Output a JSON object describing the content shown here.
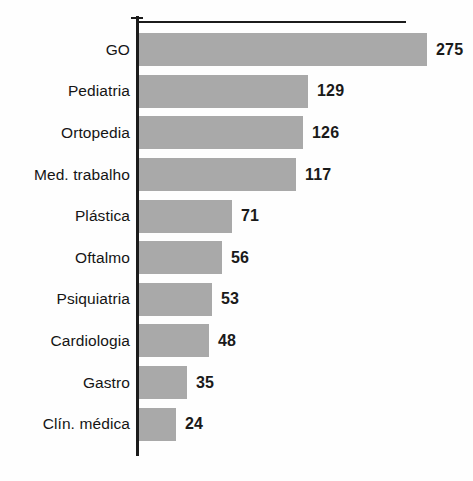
{
  "chart_data": {
    "type": "bar",
    "orientation": "horizontal",
    "title": "",
    "subtitle": "",
    "xlabel": "",
    "ylabel": "",
    "grid": false,
    "legend": null,
    "xlim": [
      0,
      300
    ],
    "axis_line_top": true,
    "categories": [
      "GO",
      "Pediatria",
      "Ortopedia",
      "Med. trabalho",
      "Plástica",
      "Oftalmo",
      "Psiquiatria",
      "Cardiologia",
      "Gastro",
      "Clín. médica"
    ],
    "values": [
      275,
      129,
      126,
      117,
      71,
      56,
      53,
      48,
      35,
      24
    ],
    "value_labels": [
      "275",
      "129",
      "126",
      "117",
      "71",
      "56",
      "53",
      "48",
      "35",
      "24"
    ],
    "bars": [
      {
        "label": "GO",
        "value": 275,
        "value_label": "275",
        "pixel_width": 288
      },
      {
        "label": "Pediatria",
        "value": 129,
        "value_label": "129",
        "pixel_width": 169
      },
      {
        "label": "Ortopedia",
        "value": 126,
        "value_label": "126",
        "pixel_width": 164
      },
      {
        "label": "Med. trabalho",
        "value": 117,
        "value_label": "117",
        "pixel_width": 157
      },
      {
        "label": "Plástica",
        "value": 71,
        "value_label": "71",
        "pixel_width": 93
      },
      {
        "label": "Oftalmo",
        "value": 56,
        "value_label": "56",
        "pixel_width": 83
      },
      {
        "label": "Psiquiatria",
        "value": 53,
        "value_label": "53",
        "pixel_width": 73
      },
      {
        "label": "Cardiologia",
        "value": 48,
        "value_label": "48",
        "pixel_width": 70
      },
      {
        "label": "Gastro",
        "value": 35,
        "value_label": "35",
        "pixel_width": 48
      },
      {
        "label": "Clín. médica",
        "value": 24,
        "value_label": "24",
        "pixel_width": 37
      }
    ],
    "colors": {
      "bar_fill": "#a9a9a9",
      "axis": "#1b1b1b",
      "text": "#151515",
      "background": "#ffffff"
    }
  }
}
